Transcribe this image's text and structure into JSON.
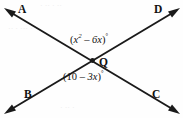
{
  "figure": {
    "type": "geometry-diagram",
    "background_color": "#fefefe",
    "stroke_color": "#1a1a1a",
    "points": [
      {
        "id": "A",
        "label": "A",
        "position": "top-left"
      },
      {
        "id": "D",
        "label": "D",
        "position": "top-right"
      },
      {
        "id": "B",
        "label": "B",
        "position": "bottom-left"
      },
      {
        "id": "C",
        "label": "C",
        "position": "bottom-right"
      },
      {
        "id": "Q",
        "label": "Q",
        "position": "center-intersection"
      }
    ],
    "lines": [
      {
        "id": "line-AC",
        "from": "A",
        "to": "C",
        "arrows": "both"
      },
      {
        "id": "line-BD",
        "from": "B",
        "to": "D",
        "arrows": "both"
      }
    ],
    "angles": [
      {
        "id": "angle-upper",
        "position": "above-vertex",
        "open_paren": "(",
        "base": "x",
        "exponent": "2",
        "operator": " – ",
        "term": "6x",
        "close_paren": ")",
        "degree": "°",
        "full_text": "(x² – 6x)°"
      },
      {
        "id": "angle-lower",
        "position": "below-vertex",
        "open_paren": "(",
        "base": "10",
        "operator": " – ",
        "term": "3x",
        "close_paren": ")",
        "degree": "°",
        "full_text": "(10 – 3x)°"
      }
    ]
  },
  "artifacts": {
    "bleed_top": "· ·· · ··",
    "bleed_mid": "·· · ··· ·",
    "bleed_bottom": "· ·· ·"
  }
}
